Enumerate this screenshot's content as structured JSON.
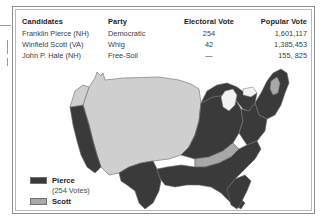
{
  "figure": {
    "table": {
      "headers": [
        "Candidates",
        "Party",
        "Electoral Vote",
        "Popular Vote"
      ],
      "rows": [
        {
          "candidate": "Franklin Pierce (NH)",
          "party": "Democratic",
          "electoral_vote": "254",
          "popular_vote": "1,601,117"
        },
        {
          "candidate": "Winfield Scott (VA)",
          "party": "Whig",
          "electoral_vote": "—",
          "popular_vote": "1,385,453"
        },
        {
          "candidate": "John P. Hale (NH)",
          "party": "Free-Soil",
          "electoral_vote": "—",
          "popular_vote": "155, 825"
        }
      ],
      "electoral_vote_display": [
        "254",
        "42",
        "—"
      ]
    },
    "legend": {
      "items": [
        {
          "label": "Pierce",
          "swatch_color": "#3a3a3a",
          "sub_label": "(254 Votes)"
        },
        {
          "label": "Scott",
          "swatch_color": "#a8a8a8",
          "sub_label": ""
        }
      ]
    },
    "map": {
      "pierce_color": "#3a3a3a",
      "scott_color": "#a8a8a8",
      "territory_color": "#cfcfcf",
      "outline_color": "#6b6b6b"
    }
  }
}
